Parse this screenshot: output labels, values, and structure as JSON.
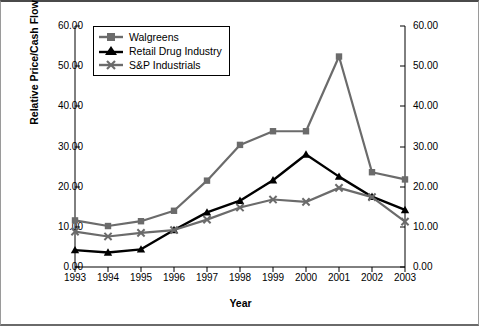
{
  "chart_data": {
    "type": "line",
    "title": "",
    "xlabel": "Year",
    "ylabel": "Relative Price/Cash Flow Ratio",
    "ylabel_right": "Relative Price/Cash Flow Ratio",
    "grid": false,
    "legend_position": "top-left",
    "x": [
      1993,
      1994,
      1995,
      1996,
      1997,
      1998,
      1999,
      2000,
      2001,
      2002,
      2003
    ],
    "categories": [
      "1993",
      "1994",
      "1995",
      "1996",
      "1997",
      "1998",
      "1999",
      "2000",
      "2001",
      "2002",
      "2003"
    ],
    "xlim": [
      1993,
      2003
    ],
    "ylim": [
      0.0,
      60.0
    ],
    "yticks": [
      0.0,
      10.0,
      20.0,
      30.0,
      40.0,
      50.0,
      60.0
    ],
    "ytick_labels": [
      "0.00",
      "10.00",
      "20.00",
      "30.00",
      "40.00",
      "50.00",
      "60.00"
    ],
    "ytick_labels_right": [
      "0.00",
      "10.00",
      "20.00",
      "30.00",
      "40.00",
      "50.00",
      "60.00"
    ],
    "series": [
      {
        "name": "Walgreens",
        "color": "#6b6b6b",
        "marker": "square",
        "values": [
          11.6,
          10.2,
          11.4,
          14.0,
          21.5,
          30.4,
          33.8,
          33.8,
          52.4,
          23.6,
          21.8
        ]
      },
      {
        "name": "Retail Drug Industry",
        "color": "#000000",
        "marker": "triangle",
        "values": [
          4.2,
          3.6,
          4.4,
          9.2,
          13.6,
          16.5,
          21.6,
          28.0,
          22.5,
          17.5,
          14.2
        ]
      },
      {
        "name": "S&P Industrials",
        "color": "#6b6b6b",
        "marker": "cross",
        "values": [
          8.8,
          7.6,
          8.5,
          9.2,
          11.8,
          14.8,
          16.8,
          16.2,
          19.7,
          17.4,
          11.3
        ]
      }
    ]
  },
  "legend": {
    "items": [
      {
        "label": "Walgreens"
      },
      {
        "label": "Retail Drug Industry"
      },
      {
        "label": "S&P Industrials"
      }
    ]
  }
}
